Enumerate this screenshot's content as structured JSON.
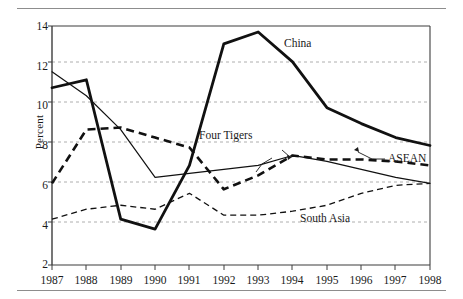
{
  "chart_data": {
    "type": "line",
    "title": "",
    "subtitle": "",
    "xlabel": "",
    "ylabel": "Percent",
    "x": [
      1987,
      1988,
      1989,
      1990,
      1991,
      1992,
      1993,
      1994,
      1995,
      1996,
      1997,
      1998
    ],
    "categories": [
      "1987",
      "1988",
      "1989",
      "1990",
      "1991",
      "1992",
      "1993",
      "1994",
      "1995",
      "1996",
      "1997",
      "1998"
    ],
    "xlim": [
      1987,
      1998
    ],
    "ylim": [
      2,
      14
    ],
    "ytick_labels": [
      "2",
      "4",
      "6",
      "8",
      "10",
      "12",
      "14"
    ],
    "yticks": [
      2,
      4,
      6,
      8,
      10,
      12,
      14
    ],
    "grid": "horizontal-dashed",
    "legend_position": "inline-annotations",
    "series": [
      {
        "name": "China",
        "style": "thick-solid",
        "color": "#111111",
        "values": [
          10.9,
          11.3,
          4.3,
          3.8,
          7.0,
          13.1,
          13.7,
          12.2,
          9.9,
          9.1,
          8.4,
          8.0
        ]
      },
      {
        "name": "Four Tigers",
        "style": "thin-solid",
        "color": "#111111",
        "values": [
          11.7,
          10.5,
          8.8,
          6.4,
          6.6,
          6.8,
          7.0,
          7.5,
          7.2,
          6.8,
          6.4,
          6.1
        ]
      },
      {
        "name": "ASEAN",
        "style": "thick-dashed",
        "color": "#111111",
        "values": [
          6.1,
          8.8,
          8.9,
          8.4,
          7.9,
          5.8,
          6.5,
          7.5,
          7.3,
          7.3,
          7.2,
          7.0
        ]
      },
      {
        "name": "South Asia",
        "style": "thin-dashed",
        "color": "#111111",
        "values": [
          4.3,
          4.8,
          5.0,
          4.8,
          5.6,
          4.5,
          4.5,
          4.7,
          5.0,
          5.6,
          6.0,
          6.1
        ]
      }
    ],
    "annotations": [
      {
        "label": "China",
        "leader": false
      },
      {
        "label": "Four Tigers",
        "leader": true
      },
      {
        "label": "ASEAN",
        "leader": true
      },
      {
        "label": "South Asia",
        "leader": false
      }
    ]
  }
}
